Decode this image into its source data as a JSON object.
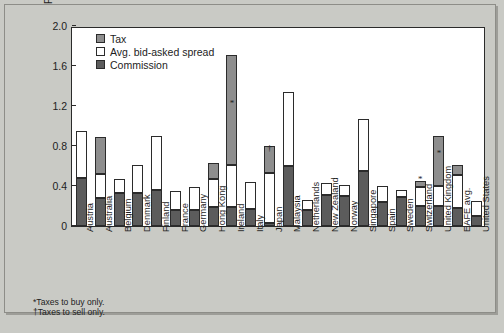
{
  "chart_data": {
    "type": "bar",
    "title": "",
    "subtitle": "",
    "xlabel": "",
    "ylabel": "Percent of transaction value",
    "ylim": [
      0,
      2.0
    ],
    "yticks": [
      "0",
      "0.4",
      "0.8",
      "1.2",
      "1.6",
      "2.0"
    ],
    "ytick_values": [
      0,
      0.4,
      0.8,
      1.2,
      1.6,
      2.0
    ],
    "grid": false,
    "stacked": true,
    "legend_position": "top-left",
    "legend": [
      "Tax",
      "Avg. bid-asked spread",
      "Commission"
    ],
    "series": [
      {
        "name": "Commission",
        "color": "#5c5c5c",
        "values": [
          0.48,
          0.28,
          0.33,
          0.33,
          0.36,
          0.16,
          0.16,
          0.19,
          0.19,
          0.17,
          0.03,
          0.6,
          0.16,
          0.31,
          0.3,
          0.55,
          0.24,
          0.29,
          0.2,
          0.2,
          0.18,
          0.1
        ]
      },
      {
        "name": "Avg. bid-asked spread",
        "color": "#ffffff",
        "values": [
          0.47,
          0.24,
          0.14,
          0.28,
          0.54,
          0.19,
          0.23,
          0.28,
          0.42,
          0.27,
          0.5,
          0.74,
          0.1,
          0.12,
          0.11,
          0.52,
          0.16,
          0.07,
          0.19,
          0.2,
          0.33,
          0.15
        ]
      },
      {
        "name": "Tax",
        "color": "#8e8e8e",
        "values": [
          0.0,
          0.37,
          0.0,
          0.0,
          0.0,
          0.0,
          0.0,
          0.16,
          1.1,
          0.0,
          0.27,
          0.0,
          0.0,
          0.0,
          0.0,
          0.0,
          0.0,
          0.0,
          0.06,
          0.5,
          0.1,
          0.0
        ]
      }
    ],
    "categories": [
      "Austria",
      "Australia",
      "Belgium",
      "Denmark",
      "Finland",
      "France",
      "Germany",
      "Hong Kong",
      "Ireland",
      "Italy",
      "Japan",
      "Malaysia",
      "Netherlands",
      "New Zealand",
      "Norway",
      "Singapore",
      "Spain",
      "Sweden",
      "Switzerland",
      "United Kingdom",
      "EAFE avg.",
      "United States"
    ],
    "totals": [
      0.95,
      0.89,
      0.47,
      0.61,
      0.9,
      0.35,
      0.39,
      0.63,
      1.71,
      0.44,
      0.8,
      1.34,
      0.26,
      0.43,
      0.41,
      1.07,
      0.4,
      0.36,
      0.45,
      0.9,
      0.61,
      0.25
    ],
    "annotations": [
      {
        "category": "Ireland",
        "symbol": "*",
        "at_value": 1.18,
        "meaning": "Taxes to buy only."
      },
      {
        "category": "Japan",
        "symbol": "†",
        "at_value": 0.73,
        "meaning": "Taxes to sell only."
      },
      {
        "category": "Switzerland",
        "symbol": "*",
        "at_value": 0.42,
        "meaning": "Taxes to buy only."
      },
      {
        "category": "United Kingdom",
        "symbol": "*",
        "at_value": 0.68,
        "meaning": "Taxes to buy only."
      }
    ]
  },
  "legend": {
    "items": [
      {
        "label": "Tax",
        "key": "tax"
      },
      {
        "label": "Avg. bid-asked spread",
        "key": "spread"
      },
      {
        "label": "Commission",
        "key": "commission"
      }
    ]
  },
  "axis": {
    "y_title": "Percent of transaction value"
  },
  "footnotes": {
    "line1": "*Taxes to buy only.",
    "line2": "†Taxes to sell only."
  },
  "caption": {
    "text": ""
  },
  "colors": {
    "tax": "#8e8e8e",
    "spread": "#ffffff",
    "commission": "#5c5c5c",
    "frame": "#2b2b2b",
    "background": "#c9cac5"
  }
}
